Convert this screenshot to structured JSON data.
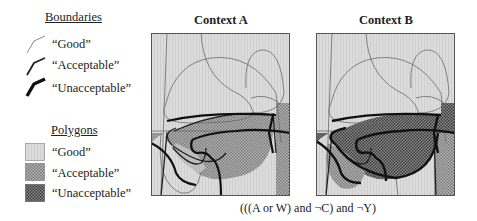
{
  "legend": {
    "boundaries": {
      "heading": "Boundaries",
      "items": [
        {
          "label": "“Good”",
          "stroke_width": 0.8,
          "color": "#6a6a6a"
        },
        {
          "label": "“Acceptable”",
          "stroke_width": 1.8,
          "color": "#222222"
        },
        {
          "label": "“Unacceptable”",
          "stroke_width": 3.4,
          "color": "#111111"
        }
      ]
    },
    "polygons": {
      "heading": "Polygons",
      "items": [
        {
          "label": "“Good”",
          "fill": "#d8d8d8"
        },
        {
          "label": "“Acceptable”",
          "fill": "#9a9a9a"
        },
        {
          "label": "“Unacceptable”",
          "fill": "#5e5e5e"
        }
      ]
    }
  },
  "panels": [
    {
      "title": "Context A"
    },
    {
      "title": "Context B"
    }
  ],
  "caption": "(((A or W) and ¬C) and ¬Y)"
}
